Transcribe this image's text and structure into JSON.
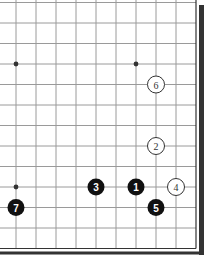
{
  "diagram": {
    "type": "go-board-corner",
    "grid": {
      "columns_x": [
        16,
        36,
        56,
        76,
        96,
        116,
        136,
        156,
        176,
        196
      ],
      "rows_y": [
        2.5,
        23,
        43.5,
        64,
        84.5,
        105,
        125.5,
        146,
        166.5,
        187,
        207.5,
        228,
        248.5
      ],
      "line_color": "#9a9a9a"
    },
    "star_points": [
      {
        "x": 16,
        "y": 64
      },
      {
        "x": 136,
        "y": 64
      },
      {
        "x": 16,
        "y": 187
      }
    ],
    "stones": [
      {
        "n": "1",
        "color": "black",
        "x": 136,
        "y": 187
      },
      {
        "n": "2",
        "color": "white",
        "x": 156,
        "y": 146
      },
      {
        "n": "3",
        "color": "black",
        "x": 96,
        "y": 187
      },
      {
        "n": "4",
        "color": "white",
        "x": 176,
        "y": 187
      },
      {
        "n": "5",
        "color": "black",
        "x": 156,
        "y": 207.5
      },
      {
        "n": "6",
        "color": "white",
        "x": 156,
        "y": 84.5
      },
      {
        "n": "7",
        "color": "black",
        "x": 16,
        "y": 207.5
      }
    ],
    "frame_color": "#333333"
  }
}
